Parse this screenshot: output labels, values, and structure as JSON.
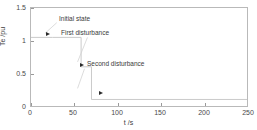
{
  "chart_data": {
    "type": "line",
    "title": "",
    "xlabel": "t /s",
    "ylabel": "Te /pu",
    "xlim": [
      0,
      250
    ],
    "ylim": [
      0,
      1.5
    ],
    "grid": false,
    "legend": "none",
    "xticks": [
      "0",
      "50",
      "100",
      "150",
      "200",
      "250"
    ],
    "xtick_values": [
      0,
      50,
      100,
      150,
      200,
      250
    ],
    "yticks": [
      "0",
      "0.5",
      "1",
      "1.5"
    ],
    "ytick_values": [
      0,
      0.5,
      1,
      1.5
    ],
    "series": [
      {
        "name": "Te",
        "x": [
          0,
          25,
          58,
          58,
          70,
          70,
          250
        ],
        "values": [
          1.05,
          1.05,
          1.05,
          0.6,
          0.6,
          0.1,
          0.1
        ]
      }
    ],
    "annotations": [
      {
        "id": "initial-state",
        "label": "Initial state",
        "text_x": 30,
        "text_y": 1.38,
        "point_x": 22,
        "point_y": 1.05,
        "marker": "arrow-right",
        "marker_shown": false
      },
      {
        "id": "first-disturbance",
        "label": "First disturbance",
        "text_x": 42,
        "text_y": 1.16,
        "point_x": 22,
        "point_y": 1.08,
        "marker": "arrow-right",
        "marker_shown": true
      },
      {
        "id": "second-disturbance",
        "label": "Second disturbance",
        "text_x": 72,
        "text_y": 0.63,
        "point_x": 59,
        "point_y": 0.6,
        "marker": "arrow-right",
        "marker_shown": true
      },
      {
        "id": "third-marker",
        "label": "",
        "text_x": 0,
        "text_y": 0,
        "point_x": 82,
        "point_y": 0.12,
        "marker": "arrow-right",
        "marker_shown": true
      }
    ],
    "colors": {
      "line": "#c9c9c9",
      "frame": "#b9b9b9",
      "tick_text": "#4a4a4a",
      "annotation_text": "#3a3a3a",
      "marker": "#2b2b2b",
      "background": "#ffffff"
    }
  }
}
